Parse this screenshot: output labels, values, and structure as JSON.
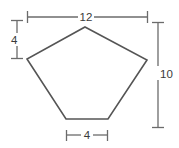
{
  "figure": {
    "canvas": {
      "width": 179,
      "height": 148
    },
    "colors": {
      "background": "#ffffff",
      "shape_stroke": "#555555",
      "shape_fill": "#ffffff",
      "dimension_stroke": "#6b6b6b",
      "label_text": "#3a3a3a"
    },
    "shape": {
      "name": "pentagon",
      "sides": 5,
      "vertices": [
        {
          "label": "apex",
          "x": 85,
          "y": 27
        },
        {
          "label": "right",
          "x": 147,
          "y": 60
        },
        {
          "label": "bottom-right",
          "x": 108,
          "y": 119
        },
        {
          "label": "bottom-left",
          "x": 66,
          "y": 119
        },
        {
          "label": "left",
          "x": 27,
          "y": 59
        }
      ]
    },
    "dimensions": [
      {
        "id": "top",
        "value": "12",
        "orientation": "horizontal",
        "label_x": 86,
        "label_y": 21,
        "line_y": 17,
        "line_x1": 27,
        "line_x2": 148,
        "gap_x1": 78,
        "gap_x2": 94
      },
      {
        "id": "left",
        "value": "4",
        "orientation": "vertical",
        "label_x": 11,
        "label_y": 44,
        "line_x": 17,
        "line_y1": 20,
        "line_y2": 59,
        "gap_y1": 33,
        "gap_y2": 46
      },
      {
        "id": "right",
        "value": "10",
        "orientation": "vertical",
        "label_x": 161,
        "label_y": 78,
        "line_x": 158,
        "line_y1": 22,
        "line_y2": 128,
        "gap_y1": 66,
        "gap_y2": 80
      },
      {
        "id": "bottom",
        "value": "4",
        "orientation": "horizontal",
        "label_x": 87,
        "label_y": 139,
        "line_y": 135,
        "line_x1": 66,
        "line_x2": 108,
        "gap_x1": 81,
        "gap_x2": 93
      }
    ]
  }
}
